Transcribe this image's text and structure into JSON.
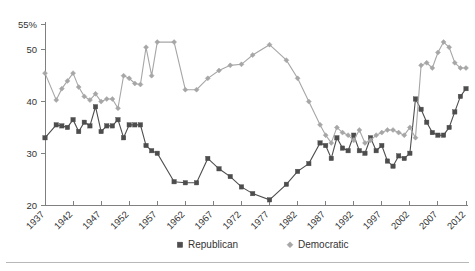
{
  "chart_data": {
    "type": "line",
    "title": "",
    "subtitle": "",
    "xlabel": "",
    "ylabel": "",
    "xlim": [
      1937,
      2012
    ],
    "ylim": [
      20,
      55
    ],
    "yticks": [
      20,
      30,
      40,
      50,
      55
    ],
    "ytick_labels": [
      "20",
      "30",
      "40",
      "50",
      "55%"
    ],
    "xticks": [
      1937,
      1942,
      1947,
      1952,
      1957,
      1962,
      1967,
      1972,
      1977,
      1982,
      1987,
      1992,
      1997,
      2002,
      2007,
      2012
    ],
    "xtick_labels": [
      "1937",
      "1942",
      "1947",
      "1952",
      "1957",
      "1962",
      "1967",
      "1972",
      "1977",
      "1982",
      "1987",
      "1992",
      "1997",
      "2002",
      "2007",
      "2012"
    ],
    "grid": false,
    "legend_position": "bottom",
    "colors": {
      "republican": "#4d4d4d",
      "democratic": "#a6a6a6",
      "axis": "#808080",
      "text": "#333333",
      "background": "#ffffff",
      "footer_rule": "#b8b8b8"
    },
    "markers": {
      "republican": "square",
      "democratic": "diamond"
    },
    "series": [
      {
        "name": "Republican",
        "marker": "square",
        "color": "#4d4d4d",
        "x": [
          1937,
          1939,
          1940,
          1941,
          1942,
          1943,
          1944,
          1945,
          1946,
          1947,
          1948,
          1949,
          1950,
          1951,
          1952,
          1953,
          1954,
          1955,
          1956,
          1957,
          1960,
          1962,
          1964,
          1966,
          1968,
          1970,
          1972,
          1974,
          1977,
          1980,
          1982,
          1984,
          1986,
          1987,
          1988,
          1989,
          1990,
          1991,
          1992,
          1993,
          1994,
          1995,
          1996,
          1997,
          1998,
          1999,
          2000,
          2001,
          2002,
          2003,
          2004,
          2005,
          2006,
          2007,
          2008,
          2009,
          2010,
          2011,
          2012
        ],
        "values": [
          33.0,
          35.5,
          35.3,
          35.0,
          36.5,
          34.2,
          36.0,
          35.3,
          39.0,
          34.2,
          35.3,
          35.3,
          36.5,
          33.0,
          35.5,
          35.5,
          35.5,
          31.5,
          30.5,
          30.0,
          24.5,
          24.3,
          24.3,
          29.0,
          27.0,
          25.5,
          23.5,
          22.2,
          21.0,
          24.0,
          26.5,
          28.0,
          32.0,
          31.5,
          29.0,
          33.0,
          31.0,
          30.5,
          33.5,
          30.5,
          30.0,
          33.0,
          30.5,
          31.5,
          28.5,
          27.5,
          29.5,
          29.0,
          30.0,
          40.5,
          38.5,
          36.0,
          34.0,
          33.5,
          33.5,
          35.0,
          38.0,
          41.0,
          42.5
        ]
      },
      {
        "name": "Democratic",
        "marker": "diamond",
        "color": "#a6a6a6",
        "x": [
          1937,
          1939,
          1940,
          1941,
          1942,
          1943,
          1944,
          1945,
          1946,
          1947,
          1948,
          1949,
          1950,
          1951,
          1952,
          1953,
          1954,
          1955,
          1956,
          1957,
          1960,
          1962,
          1964,
          1966,
          1968,
          1970,
          1972,
          1974,
          1977,
          1980,
          1982,
          1984,
          1986,
          1987,
          1988,
          1989,
          1990,
          1991,
          1992,
          1993,
          1994,
          1995,
          1996,
          1997,
          1998,
          1999,
          2000,
          2001,
          2002,
          2003,
          2004,
          2005,
          2006,
          2007,
          2008,
          2009,
          2010,
          2011,
          2012
        ],
        "values": [
          45.5,
          40.3,
          42.5,
          44.0,
          45.5,
          42.8,
          41.0,
          40.3,
          41.5,
          40.0,
          40.5,
          40.5,
          38.7,
          45.0,
          44.5,
          43.5,
          43.3,
          50.5,
          45.0,
          51.5,
          51.5,
          42.3,
          42.3,
          44.5,
          46.0,
          47.0,
          47.2,
          49.0,
          51.0,
          48.0,
          44.5,
          40.0,
          35.5,
          33.5,
          32.0,
          35.0,
          34.0,
          33.5,
          32.5,
          34.5,
          32.0,
          32.5,
          33.5,
          34.0,
          34.5,
          34.5,
          34.0,
          33.5,
          35.0,
          33.0,
          47.0,
          47.5,
          46.5,
          49.5,
          51.5,
          50.5,
          47.5,
          46.5,
          46.5
        ]
      }
    ]
  },
  "legend": {
    "items": [
      {
        "label": "Republican",
        "marker": "square",
        "color": "#4d4d4d"
      },
      {
        "label": "Democratic",
        "marker": "diamond",
        "color": "#a6a6a6"
      }
    ]
  }
}
